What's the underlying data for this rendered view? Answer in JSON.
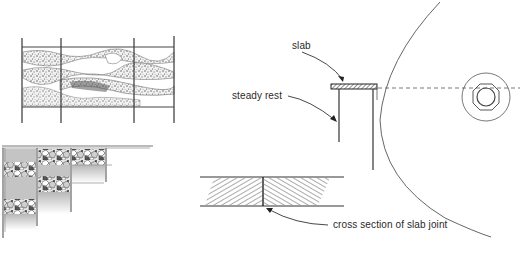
{
  "diagram": {
    "labels": {
      "slab": "slab",
      "steady_rest": "steady rest",
      "cross_section": "cross section of slab joint"
    },
    "parts": [
      {
        "id": "mosaic-panel-top-left",
        "description": "stone mosaic panel with vertical frame posts"
      },
      {
        "id": "stepped-mosaic-corner",
        "description": "stepped terrazzo/stone slab corner with shaded blocks"
      },
      {
        "id": "saw-blade-side-view",
        "description": "large circular blade with arbor nut and centerline"
      },
      {
        "id": "slab-on-steady-rest",
        "description": "hatched slab resting on steady rest supports"
      },
      {
        "id": "slab-joint-section",
        "description": "hatched cross section of slab joint"
      }
    ],
    "colors": {
      "line": "#3a3a3a",
      "light_line": "#777777",
      "shade": "#bdbdbd",
      "background": "#ffffff"
    }
  }
}
